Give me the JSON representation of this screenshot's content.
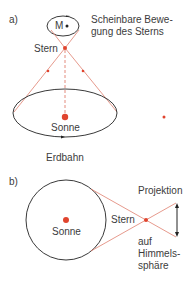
{
  "panel_a": {
    "label": "a)",
    "apparent_motion_label_line1": "Scheinbare Bewe-",
    "apparent_motion_label_line2": "gung des Sterns",
    "center_mark": "M",
    "star_label": "Stern",
    "sun_label": "Sonne",
    "orbit_label": "Erdbahn"
  },
  "panel_b": {
    "label": "b)",
    "sun_label": "Sonne",
    "star_label": "Stern",
    "projection_label": "Projektion",
    "celestial_label_line1": "auf",
    "celestial_label_line2": "Himmels-",
    "celestial_label_line3": "sphäre"
  },
  "colors": {
    "accent_red": "#e0442e",
    "line_red": "#e08070",
    "dark": "#3a3a3a"
  }
}
